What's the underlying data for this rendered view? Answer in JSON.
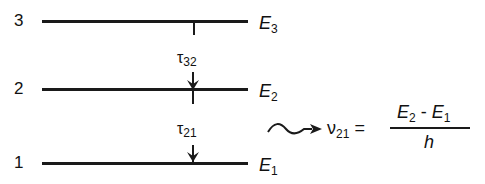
{
  "levels": [
    {
      "number": "3",
      "energy": "E",
      "energy_sub": "3"
    },
    {
      "number": "2",
      "energy": "E",
      "energy_sub": "2"
    },
    {
      "number": "1",
      "energy": "E",
      "energy_sub": "1"
    }
  ],
  "transitions": [
    {
      "symbol": "τ",
      "sub": "32"
    },
    {
      "symbol": "τ",
      "sub": "21"
    }
  ],
  "emission": {
    "lhs": "ν",
    "lhs_sub": "21",
    "equals": "=",
    "numerator_a": "E",
    "numerator_a_sub": "2",
    "minus": " - ",
    "numerator_b": "E",
    "numerator_b_sub": "1",
    "denominator": "h"
  }
}
